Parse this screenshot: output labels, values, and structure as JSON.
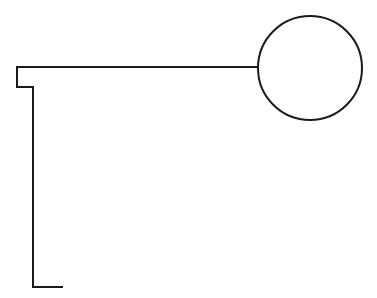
{
  "figure": {
    "title": "Key-shaped outline drawing",
    "background_color": "#ffffff",
    "stroke_color": "#1a1a1a",
    "stroke_width": 2,
    "canvas": {
      "width": 377,
      "height": 298
    },
    "shapes": [
      {
        "name": "circle-head",
        "type": "circle",
        "cx": 310,
        "cy": 68,
        "r": 52
      },
      {
        "name": "stepped-polyline",
        "type": "polyline",
        "points": "258,67 17,67 17,87 33,87 33,287 63,287",
        "vertices": [
          {
            "x": 258,
            "y": 67,
            "role": "circle-junction"
          },
          {
            "x": 17,
            "y": 67,
            "role": "top-left-corner"
          },
          {
            "x": 17,
            "y": 87,
            "role": "notch-bottom-left"
          },
          {
            "x": 33,
            "y": 87,
            "role": "notch-inner-corner"
          },
          {
            "x": 33,
            "y": 287,
            "role": "bottom-left-corner"
          },
          {
            "x": 63,
            "y": 287,
            "role": "bottom-right-end"
          }
        ]
      }
    ]
  }
}
